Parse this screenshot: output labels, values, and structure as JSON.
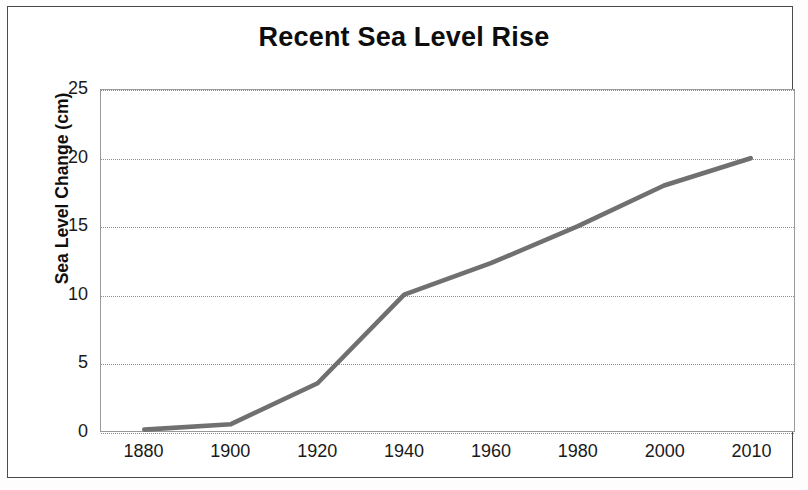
{
  "chart_data": {
    "type": "line",
    "title": "Recent Sea Level Rise",
    "xlabel": "",
    "ylabel": "Sea Level Change (cm)",
    "categories": [
      "1880",
      "1900",
      "1920",
      "1940",
      "1960",
      "1980",
      "2000",
      "2010"
    ],
    "values": [
      0.1,
      0.5,
      3.5,
      10.0,
      12.3,
      15.0,
      18.0,
      20.0
    ],
    "series": [
      {
        "name": "Sea Level Change",
        "values": [
          0.1,
          0.5,
          3.5,
          10.0,
          12.3,
          15.0,
          18.0,
          20.0
        ],
        "color": "#707070"
      }
    ],
    "ylim": [
      0,
      25
    ],
    "ytick_labels": [
      "0",
      "5",
      "10",
      "15",
      "20",
      "25"
    ],
    "ytick_values": [
      0,
      5,
      10,
      15,
      20,
      25
    ],
    "grid": "horizontal-dotted",
    "legend": "none",
    "line_color": "#707070",
    "gridline_color": "#8d8d8d",
    "plot_border_color": "#9a9a9a",
    "frame_color": "#4a4a4a",
    "background_color": "#ffffff"
  }
}
